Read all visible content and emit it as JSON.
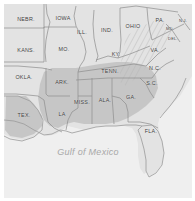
{
  "figure": {
    "kind": "reference-map",
    "background_color": "#ffffff",
    "land_color": "#e3e3e3",
    "highlight_color": "#c6c6c6",
    "water_color": "#efefef",
    "border_color": "#8d8d8d",
    "label_color": "#3a3a3a",
    "water_label_color": "#a8a8a8"
  },
  "water": {
    "name": "Gulf of Mexico"
  },
  "states": [
    {
      "label": "NEBR.",
      "x": 26,
      "y": 19,
      "size": "normal"
    },
    {
      "label": "IOWA",
      "x": 63,
      "y": 18,
      "size": "normal"
    },
    {
      "label": "ILL.",
      "x": 82,
      "y": 32,
      "size": "normal"
    },
    {
      "label": "IND.",
      "x": 107,
      "y": 30,
      "size": "normal"
    },
    {
      "label": "OHIO",
      "x": 133,
      "y": 26,
      "size": "normal"
    },
    {
      "label": "PA.",
      "x": 160,
      "y": 20,
      "size": "normal"
    },
    {
      "label": "N.J.",
      "x": 183,
      "y": 20,
      "size": "tiny"
    },
    {
      "label": "MD.",
      "x": 170,
      "y": 28,
      "size": "tiny"
    },
    {
      "label": "DEL.",
      "x": 173,
      "y": 38,
      "size": "tiny"
    },
    {
      "label": "KANS.",
      "x": 26,
      "y": 50,
      "size": "normal"
    },
    {
      "label": "MO.",
      "x": 64,
      "y": 49,
      "size": "normal"
    },
    {
      "label": "KY.",
      "x": 116,
      "y": 54,
      "size": "normal"
    },
    {
      "label": "VA.",
      "x": 155,
      "y": 50,
      "size": "normal"
    },
    {
      "label": "OKLA.",
      "x": 24,
      "y": 77,
      "size": "normal"
    },
    {
      "label": "ARK.",
      "x": 62,
      "y": 82,
      "size": "normal"
    },
    {
      "label": "TENN.",
      "x": 110,
      "y": 71,
      "size": "normal"
    },
    {
      "label": "N.C.",
      "x": 155,
      "y": 68,
      "size": "normal"
    },
    {
      "label": "S.C.",
      "x": 152,
      "y": 83,
      "size": "normal"
    },
    {
      "label": "MISS.",
      "x": 82,
      "y": 102,
      "size": "normal"
    },
    {
      "label": "ALA.",
      "x": 105,
      "y": 100,
      "size": "normal"
    },
    {
      "label": "GA.",
      "x": 131,
      "y": 97,
      "size": "normal"
    },
    {
      "label": "LA",
      "x": 62,
      "y": 114,
      "size": "normal"
    },
    {
      "label": "TEX.",
      "x": 24,
      "y": 115,
      "size": "normal"
    },
    {
      "label": "FLA.",
      "x": 151,
      "y": 131,
      "size": "normal"
    }
  ]
}
